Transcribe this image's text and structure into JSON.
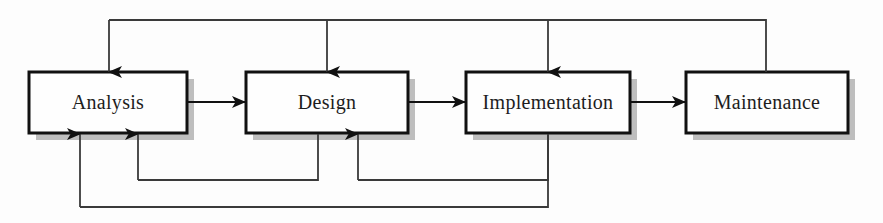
{
  "diagram": {
    "type": "process-flow",
    "background_color": "#fdfdfd",
    "box_fill_color": "#fefefe",
    "box_border_color": "#111111",
    "shadow_color": "#a8a8a8",
    "line_color": "#3a3a3a",
    "arrow_color": "#111111",
    "text_color": "#1d1d1d",
    "stages": [
      {
        "id": "analysis",
        "label": "Analysis",
        "x": 29,
        "y": 72,
        "width": 158,
        "height": 61
      },
      {
        "id": "design",
        "label": "Design",
        "x": 246,
        "y": 72,
        "width": 162,
        "height": 61
      },
      {
        "id": "implementation",
        "label": "Implementation",
        "x": 466,
        "y": 72,
        "width": 164,
        "height": 61
      },
      {
        "id": "maintenance",
        "label": "Maintenance",
        "x": 686,
        "y": 72,
        "width": 162,
        "height": 61
      }
    ],
    "forward_arrows": [
      {
        "id": "analysis-to-design",
        "from": "analysis",
        "to": "design",
        "x1": 188,
        "x2": 245,
        "y": 102
      },
      {
        "id": "design-to-implementation",
        "from": "design",
        "to": "implementation",
        "x1": 409,
        "x2": 465,
        "y": 102
      },
      {
        "id": "implementation-to-maintenance",
        "from": "implementation",
        "to": "maintenance",
        "x1": 631,
        "x2": 685,
        "y": 102
      }
    ],
    "feedback_top": {
      "id": "maintenance-feedback-bus",
      "bus_y": 20,
      "source_x": 766,
      "source_y": 72,
      "targets": [
        {
          "id": "feedback-to-analysis",
          "x": 109,
          "y": 72
        },
        {
          "id": "feedback-to-design",
          "x": 327,
          "y": 72
        },
        {
          "id": "feedback-to-implementation",
          "x": 548,
          "y": 72
        }
      ]
    },
    "feedback_bottom": [
      {
        "id": "implementation-to-design-feedback",
        "source_x": 548,
        "bus_y": 180,
        "target_x": 358,
        "target_y": 134
      },
      {
        "id": "design-to-analysis-feedback",
        "source_x": 318,
        "bus_y": 180,
        "target_x": 138,
        "target_y": 134
      },
      {
        "id": "implementation-to-analysis-feedback",
        "source_x": 548,
        "bus_y": 207,
        "target_x": 80,
        "target_y": 134
      }
    ]
  }
}
